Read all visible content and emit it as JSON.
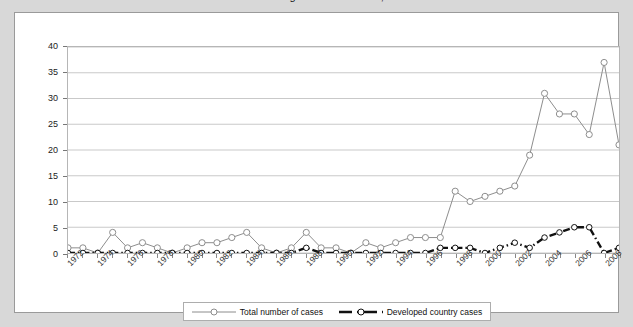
{
  "title": "Number of cases registered worldwide, 1972-2009",
  "colors": {
    "page_background": "#d8d8d8",
    "card_background": "#ffffff",
    "plot_border": "#b6b6b6",
    "gridline": "#c9c9c9",
    "total_series": "#8c8c8c",
    "developed_series": "#111111",
    "legend_border": "#adadad"
  },
  "legend": {
    "position": "bottom-center",
    "items": [
      {
        "label": "Total number of cases",
        "marker": "open-circle",
        "line": "thin-solid"
      },
      {
        "label": "Developed country cases",
        "marker": "open-circle",
        "line": "thick-dashed"
      }
    ]
  },
  "chart_data": {
    "type": "line",
    "title": "Number of cases registered worldwide, 1972-2009",
    "xlabel": "",
    "ylabel": "",
    "ylim": [
      0,
      40
    ],
    "yticks": [
      0,
      5,
      10,
      15,
      20,
      25,
      30,
      35,
      40
    ],
    "grid": true,
    "xlim": [
      1972,
      2009
    ],
    "x": [
      1972,
      1973,
      1974,
      1975,
      1976,
      1977,
      1978,
      1979,
      1980,
      1981,
      1982,
      1983,
      1984,
      1985,
      1986,
      1987,
      1988,
      1989,
      1990,
      1991,
      1992,
      1993,
      1994,
      1995,
      1996,
      1997,
      1998,
      1999,
      2000,
      2001,
      2002,
      2003,
      2004,
      2005,
      2006,
      2007,
      2008,
      2009
    ],
    "xtick_labels": [
      "1972",
      "1974",
      "1976",
      "1978",
      "1980",
      "1982",
      "1984",
      "1986",
      "1988",
      "1990",
      "1992",
      "1994",
      "1996",
      "1998",
      "2000",
      "2002",
      "2004",
      "2006",
      "2008"
    ],
    "xtick_values": [
      1972,
      1974,
      1976,
      1978,
      1980,
      1982,
      1984,
      1986,
      1988,
      1990,
      1992,
      1994,
      1996,
      1998,
      2000,
      2002,
      2004,
      2006,
      2008
    ],
    "series": [
      {
        "name": "Total number of cases",
        "marker": "open-circle",
        "values": [
          1,
          1,
          0,
          4,
          1,
          2,
          1,
          0,
          1,
          2,
          2,
          3,
          4,
          1,
          0,
          1,
          4,
          1,
          1,
          0,
          2,
          1,
          2,
          3,
          3,
          3,
          12,
          10,
          11,
          12,
          13,
          19,
          31,
          27,
          27,
          23,
          37,
          21
        ]
      },
      {
        "name": "Developed country cases",
        "marker": "open-circle",
        "values": [
          0,
          0,
          0,
          0,
          0,
          0,
          0,
          0,
          0,
          0,
          0,
          0,
          0,
          0,
          0,
          0,
          1,
          0,
          0,
          0,
          0,
          0,
          0,
          0,
          0,
          1,
          1,
          1,
          0,
          1,
          2,
          1,
          3,
          4,
          5,
          5,
          0,
          1
        ]
      }
    ]
  }
}
